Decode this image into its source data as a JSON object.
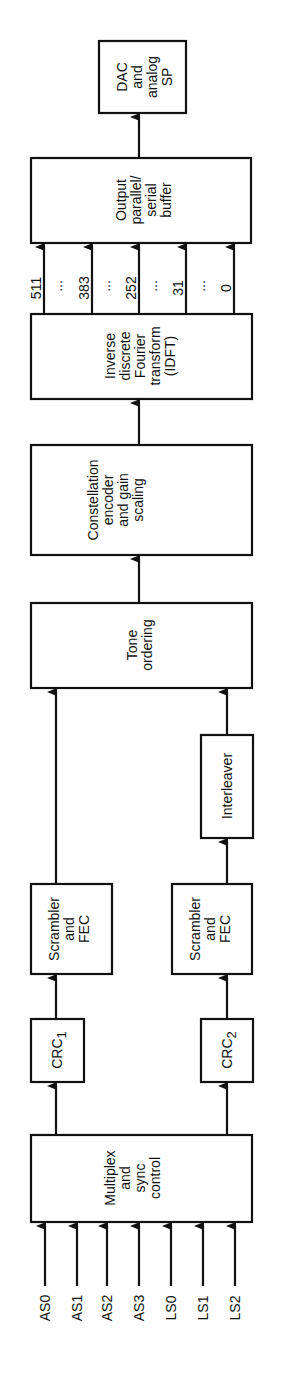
{
  "diagram": {
    "orientation": "rotated-90-ccw",
    "blocks": {
      "multiplex": [
        "Multiplex",
        "and",
        "sync",
        "control"
      ],
      "crc1": {
        "base": "CRC",
        "sub": "1"
      },
      "crc2": {
        "base": "CRC",
        "sub": "2"
      },
      "scrambler1": [
        "Scrambler",
        "and",
        "FEC"
      ],
      "scrambler2": [
        "Scrambler",
        "and",
        "FEC"
      ],
      "interleaver": [
        "Interleaver"
      ],
      "tone": [
        "Tone",
        "ordering"
      ],
      "constellation": [
        "Constellation",
        "encoder",
        "and gain",
        "scaling"
      ],
      "idft": [
        "Inverse",
        "discrete",
        "Fourier",
        "transform",
        "(IDFT)"
      ],
      "output": [
        "Output",
        "parallel/",
        "serial",
        "buffer"
      ],
      "dac": [
        "DAC",
        "and",
        "analog",
        "SP"
      ]
    },
    "inputs": [
      "AS0",
      "AS1",
      "AS2",
      "AS3",
      "LS0",
      "LS1",
      "LS2"
    ],
    "channels": [
      "511",
      "383",
      "252",
      "31",
      "0"
    ],
    "ellipsis": "..."
  }
}
